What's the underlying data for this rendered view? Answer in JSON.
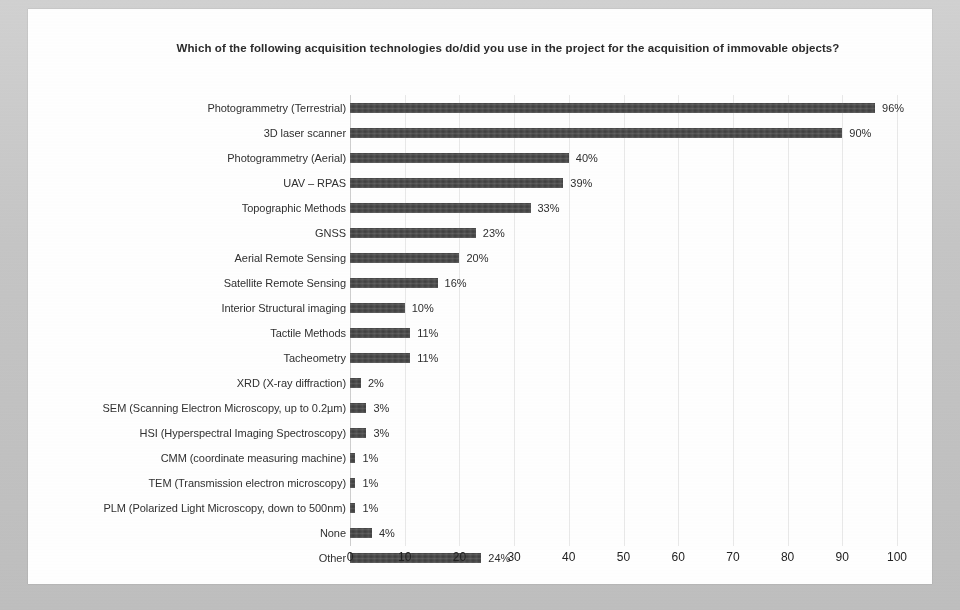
{
  "chart_data": {
    "type": "bar",
    "orientation": "horizontal",
    "title": "Which of the following acquisition technologies do/did you use in the project for the acquisition of immovable objects?",
    "xlabel": "",
    "ylabel": "",
    "xlim": [
      0,
      100
    ],
    "xticks": [
      0,
      10,
      20,
      30,
      40,
      50,
      60,
      70,
      80,
      90,
      100
    ],
    "xtick_labels": [
      "0",
      "10",
      "20",
      "30",
      "40",
      "50",
      "60",
      "70",
      "80",
      "90",
      "100"
    ],
    "grid": true,
    "grid_axis": "x",
    "legend": false,
    "value_label_suffix": "%",
    "bar_color": "#3f3f3f",
    "categories": [
      "Photogrammetry (Terrestrial)",
      "3D laser scanner",
      "Photogrammetry (Aerial)",
      "UAV – RPAS",
      "Topographic Methods",
      "GNSS",
      "Aerial Remote Sensing",
      "Satellite Remote Sensing",
      "Interior Structural imaging",
      "Tactile Methods",
      "Tacheometry",
      "XRD (X-ray diffraction)",
      "SEM (Scanning Electron Microscopy, up to 0.2µm)",
      "HSI (Hyperspectral Imaging Spectroscopy)",
      "CMM (coordinate measuring machine)",
      "TEM (Transmission electron microscopy)",
      "PLM (Polarized Light Microscopy, down to 500nm)",
      "None",
      "Other"
    ],
    "values": [
      96,
      90,
      40,
      39,
      33,
      23,
      20,
      16,
      10,
      11,
      11,
      2,
      3,
      3,
      1,
      1,
      1,
      4,
      24
    ],
    "value_labels": [
      "96%",
      "90%",
      "40%",
      "39%",
      "33%",
      "23%",
      "20%",
      "16%",
      "10%",
      "11%",
      "11%",
      "2%",
      "3%",
      "3%",
      "1%",
      "1%",
      "1%",
      "4%",
      "24%"
    ]
  }
}
